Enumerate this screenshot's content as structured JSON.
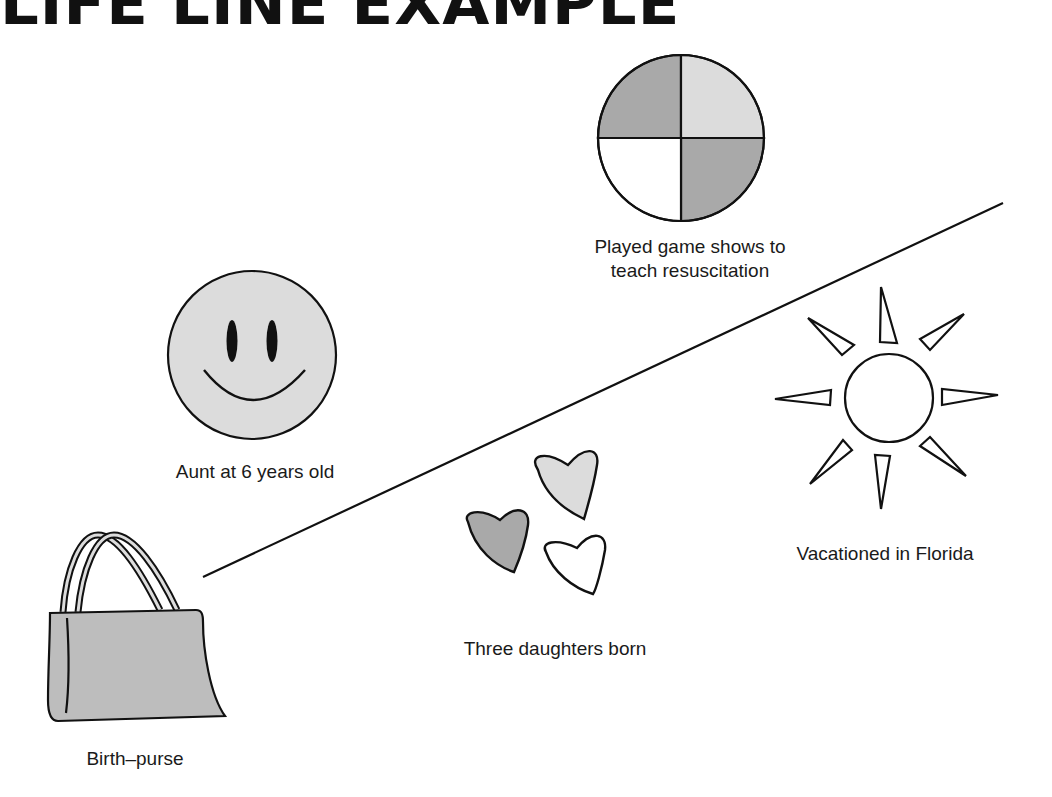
{
  "title": "LIFE LINE EXAMPLE",
  "timeline": {
    "from": [
      203,
      577
    ],
    "to": [
      1003,
      203
    ]
  },
  "events": [
    {
      "id": "birth",
      "label": "Birth–purse",
      "icon": "purse-icon"
    },
    {
      "id": "aunt",
      "label": "Aunt at 6 years old",
      "icon": "smiley-face-icon"
    },
    {
      "id": "daughters",
      "label": "Three daughters born",
      "icon": "three-hearts-icon"
    },
    {
      "id": "game-shows",
      "label_lines": [
        "Played game shows to",
        "teach resuscitation"
      ],
      "icon": "quartered-circle-icon"
    },
    {
      "id": "florida",
      "label": "Vacationed in Florida",
      "icon": "sun-icon"
    }
  ],
  "colors": {
    "dark_gray": "#a9a9a9",
    "light_gray": "#dcdcdc",
    "mid_gray": "#bdbdbd",
    "line": "#111111"
  }
}
